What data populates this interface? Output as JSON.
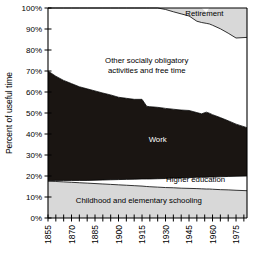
{
  "chart_data": {
    "type": "area",
    "title": "",
    "subtitle": "",
    "xlabel": "",
    "ylabel": "Percent of useful time",
    "stacked": true,
    "grid": false,
    "legend_position": "inline-labels",
    "xlim": [
      1855,
      1982
    ],
    "ylim": [
      0,
      100
    ],
    "y_tick_labels": [
      "0%",
      "10%",
      "20%",
      "30%",
      "40%",
      "50%",
      "60%",
      "70%",
      "80%",
      "90%",
      "100%"
    ],
    "y_tick_values": [
      0,
      10,
      20,
      30,
      40,
      50,
      60,
      70,
      80,
      90,
      100
    ],
    "x_tick_labels": [
      "1855",
      "1870",
      "1885",
      "1900",
      "1915",
      "1930",
      "1945",
      "1960",
      "1975"
    ],
    "x_tick_values": [
      1855,
      1870,
      1885,
      1900,
      1915,
      1930,
      1945,
      1960,
      1975
    ],
    "x_minor_tick_step": 5,
    "colors": {
      "work": "#1a1512",
      "childhood": "#d8d8d8",
      "retirement": "#d8d8d8",
      "free_time": "#ffffff",
      "higher_education": "#ffffff",
      "axis": "#000000",
      "background": "#ffffff"
    },
    "x": [
      1855,
      1860,
      1865,
      1870,
      1875,
      1880,
      1885,
      1890,
      1895,
      1900,
      1905,
      1910,
      1915,
      1918,
      1920,
      1925,
      1930,
      1935,
      1940,
      1945,
      1950,
      1953,
      1956,
      1958,
      1960,
      1965,
      1970,
      1975,
      1982
    ],
    "series": [
      {
        "name": "Childhood and elementary schooling",
        "label": "Childhood and elementary schooling",
        "values": [
          17.5,
          17.4,
          17.2,
          17.0,
          16.8,
          16.6,
          16.4,
          16.2,
          16.0,
          15.8,
          15.6,
          15.4,
          15.2,
          15.0,
          14.9,
          14.7,
          14.5,
          14.4,
          14.2,
          14.1,
          14.0,
          13.9,
          13.8,
          13.8,
          13.7,
          13.5,
          13.4,
          13.2,
          13.0
        ]
      },
      {
        "name": "Higher education",
        "label": "Higher education",
        "values": [
          0.3,
          0.5,
          0.7,
          0.9,
          1.1,
          1.3,
          1.6,
          1.9,
          2.2,
          2.5,
          2.8,
          3.1,
          3.4,
          3.6,
          3.7,
          4.0,
          4.3,
          4.6,
          4.9,
          5.1,
          5.4,
          5.5,
          5.6,
          5.7,
          5.8,
          6.1,
          6.4,
          6.7,
          7.0
        ]
      },
      {
        "name": "Work",
        "label": "Work",
        "values": [
          52.2,
          49.6,
          47.6,
          46.1,
          44.6,
          43.6,
          42.5,
          41.4,
          40.4,
          39.2,
          38.6,
          38.0,
          37.9,
          34.6,
          34.4,
          34.0,
          33.4,
          32.8,
          32.3,
          32.0,
          30.8,
          30.2,
          31.0,
          30.4,
          29.7,
          28.2,
          26.5,
          24.8,
          23.0
        ]
      },
      {
        "name": "Other socially obligatory activities and free time",
        "label": "Other socially obligatory activities and free time",
        "values": [
          30.0,
          32.5,
          34.5,
          36.0,
          37.5,
          38.5,
          39.5,
          40.5,
          41.4,
          42.5,
          43.0,
          43.5,
          43.5,
          46.8,
          47.0,
          47.3,
          47.1,
          46.4,
          45.8,
          45.0,
          43.5,
          43.5,
          42.3,
          42.5,
          42.6,
          42.3,
          41.7,
          41.0,
          43.0
        ]
      },
      {
        "name": "Retirement",
        "label": "Retirement",
        "values": [
          0.0,
          0.0,
          0.0,
          0.0,
          0.0,
          0.0,
          0.0,
          0.0,
          0.0,
          0.0,
          0.0,
          0.0,
          0.0,
          0.0,
          0.0,
          0.0,
          0.7,
          1.8,
          2.8,
          3.8,
          6.3,
          6.9,
          5.3,
          7.6,
          8.2,
          9.9,
          12.0,
          14.3,
          14.0
        ]
      }
    ],
    "annotations": [
      {
        "text": "Retirement",
        "x": 1967,
        "y": 96
      },
      {
        "text": "Other socially obligatory",
        "x": 1918,
        "y": 74
      },
      {
        "text": "activities and free time",
        "x": 1918,
        "y": 69
      },
      {
        "text": "Work",
        "x": 1925,
        "y": 36
      },
      {
        "text": "Higher education",
        "x": 1968,
        "y": 17
      },
      {
        "text": "Childhood and elementary schooling",
        "x": 1913,
        "y": 7
      }
    ]
  }
}
